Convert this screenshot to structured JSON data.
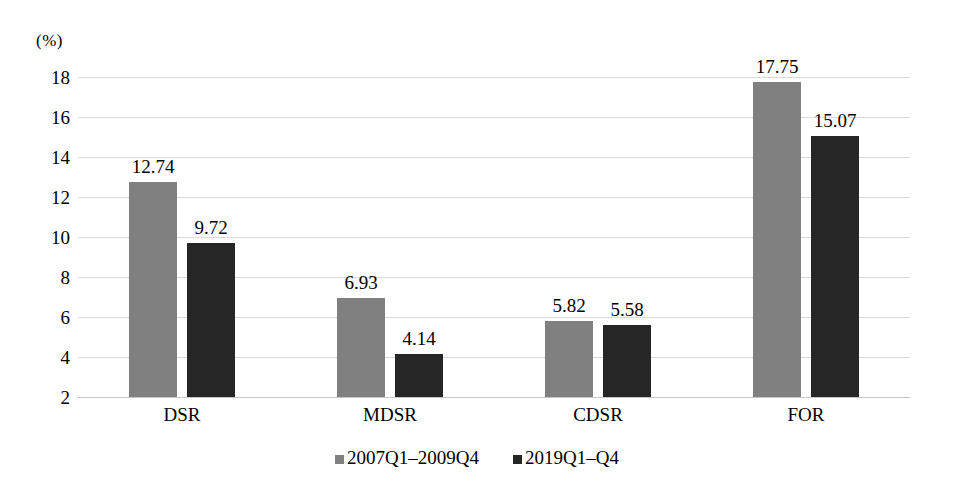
{
  "chart_data": {
    "type": "bar",
    "title": "",
    "subtitle": "",
    "xlabel": "",
    "ylabel": "(%)",
    "ylim": [
      2,
      18
    ],
    "ytick_step": 2,
    "yticks": [
      "18",
      "16",
      "14",
      "12",
      "10",
      "8",
      "6",
      "4",
      "2"
    ],
    "ytick_values": [
      18,
      16,
      14,
      12,
      10,
      8,
      6,
      4,
      2
    ],
    "grid": true,
    "legend_position": "bottom",
    "categories": [
      "DSR",
      "MDSR",
      "CDSR",
      "FOR"
    ],
    "series": [
      {
        "name": "2007Q1–2009Q4",
        "color": "#808080",
        "values": [
          12.74,
          9.72,
          5.82,
          17.75
        ],
        "labels": [
          "12.74",
          "6.93",
          "5.82",
          "17.75"
        ]
      },
      {
        "name": "2019Q1–Q4",
        "color": "#262626",
        "values": [
          9.72,
          4.14,
          5.58,
          15.07
        ],
        "labels": [
          "9.72",
          "4.14",
          "5.58",
          "15.07"
        ]
      }
    ],
    "data_by_category": [
      {
        "category": "DSR",
        "series_a": 12.74,
        "series_b": 9.72
      },
      {
        "category": "MDSR",
        "series_a": 6.93,
        "series_b": 4.14
      },
      {
        "category": "CDSR",
        "series_a": 5.82,
        "series_b": 5.58
      },
      {
        "category": "FOR",
        "series_a": 17.75,
        "series_b": 15.07
      }
    ],
    "values_a": [
      12.74,
      6.93,
      5.82,
      17.75
    ],
    "values_b": [
      9.72,
      4.14,
      5.58,
      15.07
    ],
    "labels_a": [
      "12.74",
      "6.93",
      "5.82",
      "17.75"
    ],
    "labels_b": [
      "9.72",
      "4.14",
      "5.58",
      "15.07"
    ]
  },
  "legend": {
    "items": [
      {
        "label": "2007Q1–2009Q4",
        "color": "#808080"
      },
      {
        "label": "2019Q1–Q4",
        "color": "#262626"
      }
    ]
  },
  "colors": {
    "series_a": "#808080",
    "series_b": "#262626",
    "gridline": "#d9d9d9",
    "text": "#000000",
    "background": "#ffffff"
  }
}
